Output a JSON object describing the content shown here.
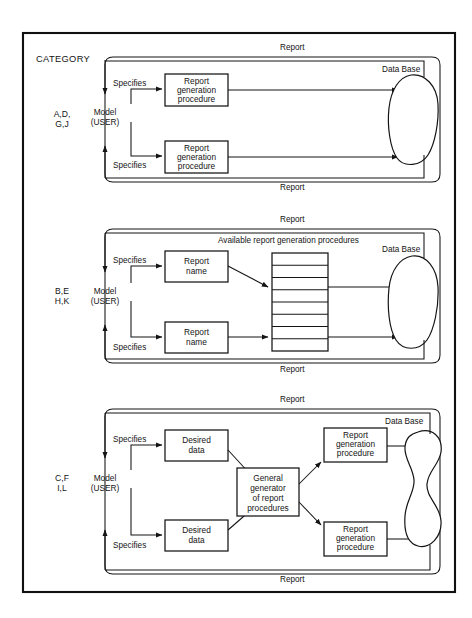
{
  "figure": {
    "frame_label": "CATEGORY",
    "caption": "",
    "stroke_color": "#141414",
    "background": "#ffffff"
  },
  "labels": {
    "report": "Report",
    "data_base": "Data Base",
    "specifies": "Specifies",
    "model": "Model",
    "user": "(USER)",
    "available_procedures": "Available report generation procedures"
  },
  "panels": [
    {
      "id": "panel-1",
      "category_line1": "A,D,",
      "category_line2": "G,J",
      "actor_line1": "Model",
      "actor_line2": "(USER)",
      "top_report": "Report",
      "bottom_report": "Report",
      "data_base": "Data Base",
      "specifies_upper": "Specifies",
      "specifies_lower": "Specifies",
      "boxes": [
        {
          "name": "report-generation-procedure-upper",
          "lines": [
            "Report",
            "generation",
            "procedure"
          ]
        },
        {
          "name": "report-generation-procedure-lower",
          "lines": [
            "Report",
            "generation",
            "procedure"
          ]
        }
      ]
    },
    {
      "id": "panel-2",
      "category_line1": "B,E",
      "category_line2": "H,K",
      "actor_line1": "Model",
      "actor_line2": "(USER)",
      "top_report": "Report",
      "bottom_report": "Report",
      "data_base": "Data Base",
      "specifies_upper": "Specifies",
      "specifies_lower": "Specifies",
      "stack_title": "Available report generation procedures",
      "stack_rows": 8,
      "boxes": [
        {
          "name": "report-name-upper",
          "lines": [
            "Report",
            "name"
          ]
        },
        {
          "name": "report-name-lower",
          "lines": [
            "Report",
            "name"
          ]
        }
      ]
    },
    {
      "id": "panel-3",
      "category_line1": "C,F",
      "category_line2": "I,L",
      "actor_line1": "Model",
      "actor_line2": "(USER)",
      "top_report": "Report",
      "bottom_report": "Report",
      "data_base": "Data Base",
      "specifies_upper": "Specifies",
      "specifies_lower": "Specifies",
      "boxes": [
        {
          "name": "desired-data-upper",
          "lines": [
            "Desired",
            "data"
          ]
        },
        {
          "name": "desired-data-lower",
          "lines": [
            "Desired",
            "data"
          ]
        },
        {
          "name": "general-generator",
          "lines": [
            "General",
            "generator",
            "of report",
            "procedures"
          ]
        },
        {
          "name": "report-generation-procedure-upper",
          "lines": [
            "Report",
            "generation",
            "procedure"
          ]
        },
        {
          "name": "report-generation-procedure-lower",
          "lines": [
            "Report",
            "generation",
            "procedure"
          ]
        }
      ]
    }
  ]
}
